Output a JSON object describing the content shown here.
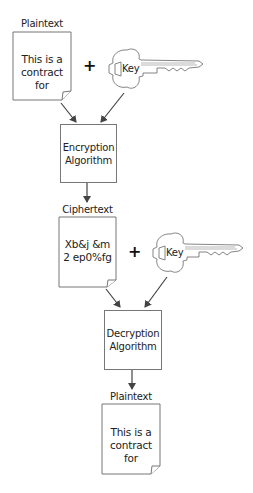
{
  "diagram": {
    "plaintext_input": {
      "label": "Plaintext",
      "lines": [
        "This is a",
        "contract for"
      ]
    },
    "key_1": {
      "label": "Key"
    },
    "operator_1": "+",
    "encryption": {
      "lines": [
        "Encryption",
        "Algorithm"
      ]
    },
    "ciphertext": {
      "label": "Ciphertext",
      "lines": [
        "Xb&j &m",
        "2 ep0%fg"
      ]
    },
    "key_2": {
      "label": "Key"
    },
    "operator_2": "+",
    "decryption": {
      "lines": [
        "Decryption",
        "Algorithm"
      ]
    },
    "plaintext_output": {
      "label": "Plaintext",
      "lines": [
        "This is a",
        "contract for"
      ]
    },
    "colors": {
      "stroke": "#777777",
      "arrow": "#444444",
      "text": "#222222"
    }
  }
}
